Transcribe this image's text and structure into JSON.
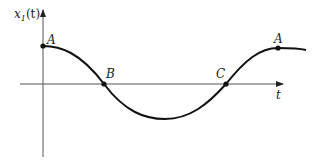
{
  "diagram": {
    "y_axis_label": "x",
    "y_axis_sub": "1",
    "y_axis_arg": "(t)",
    "x_axis_label": "t",
    "points": [
      {
        "label": "A",
        "x": 43,
        "y": 46
      },
      {
        "label": "B",
        "x": 104,
        "y": 84
      },
      {
        "label": "C",
        "x": 226,
        "y": 84
      },
      {
        "label": "A",
        "x": 278,
        "y": 48
      }
    ]
  }
}
